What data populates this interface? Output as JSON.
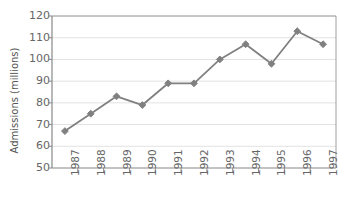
{
  "chart_data": {
    "type": "line",
    "title": "",
    "xlabel": "",
    "ylabel": "Admissions (millions)",
    "categories": [
      "1987",
      "1988",
      "1989",
      "1990",
      "1991",
      "1992",
      "1993",
      "1994",
      "1995",
      "1996",
      "1997"
    ],
    "values": [
      67,
      75,
      83,
      79,
      89,
      89,
      100,
      107,
      98,
      113,
      107
    ],
    "series": [
      {
        "name": "Admissions",
        "values": [
          67,
          75,
          83,
          79,
          89,
          89,
          100,
          107,
          98,
          113,
          107
        ]
      }
    ],
    "ylim": [
      50,
      120
    ],
    "yticks": [
      50,
      60,
      70,
      80,
      90,
      100,
      110,
      120
    ],
    "ytick_labels": [
      "50",
      "60",
      "70",
      "80",
      "90",
      "100",
      "110",
      "120"
    ],
    "grid": true,
    "grid_axis": "y",
    "legend": false,
    "legend_position": "none",
    "marker": "diamond",
    "colors": {
      "line": "#808080",
      "marker": "#808080",
      "grid": "#e2e2e2",
      "axis": "#888888",
      "tick_text": "#666666",
      "axis_title": "#555555",
      "background": "#ffffff"
    }
  }
}
